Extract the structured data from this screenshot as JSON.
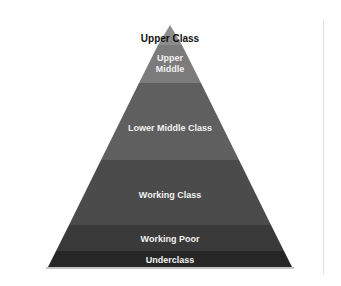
{
  "diagram": {
    "type": "pyramid",
    "title": "",
    "levels": [
      {
        "label": "Upper Class",
        "color": "#8a8a8a",
        "top": 25,
        "bottom": 45
      },
      {
        "label": "Upper\nMiddle",
        "color": "#7a7a7a",
        "top": 45,
        "bottom": 83
      },
      {
        "label": "Lower Middle Class",
        "color": "#5e5e5e",
        "top": 83,
        "bottom": 160
      },
      {
        "label": "Working Class",
        "color": "#4a4a4a",
        "top": 160,
        "bottom": 225
      },
      {
        "label": "Working Poor",
        "color": "#393939",
        "top": 225,
        "bottom": 251
      },
      {
        "label": "Underclass",
        "color": "#262626",
        "top": 251,
        "bottom": 267
      }
    ]
  },
  "labels": {
    "upper_class": "Upper Class",
    "upper_middle_line1": "Upper",
    "upper_middle_line2": "Middle",
    "lower_middle": "Lower Middle Class",
    "working_class": "Working Class",
    "working_poor": "Working Poor",
    "underclass": "Underclass"
  }
}
